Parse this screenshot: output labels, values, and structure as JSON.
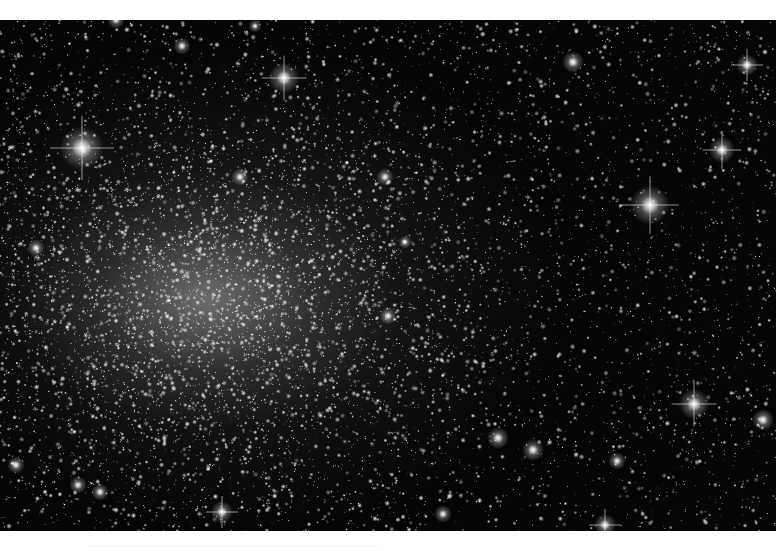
{
  "image": {
    "subject": "globular star cluster field (grayscale astronomical photograph)",
    "background_color": "#050505",
    "frame": {
      "x": 0,
      "y": 20,
      "width": 776,
      "height": 511
    },
    "cluster_core": {
      "x": 205,
      "y": 280,
      "radius_x": 190,
      "radius_y": 130
    },
    "star_density": {
      "field_stars": 5200,
      "cluster_stars": 3800
    },
    "bright_stars": [
      {
        "x": 82,
        "y": 128,
        "size": 10,
        "spikes": true
      },
      {
        "x": 650,
        "y": 185,
        "size": 9,
        "spikes": true
      },
      {
        "x": 284,
        "y": 58,
        "size": 7,
        "spikes": true
      },
      {
        "x": 722,
        "y": 130,
        "size": 6,
        "spikes": true
      },
      {
        "x": 694,
        "y": 384,
        "size": 7,
        "spikes": true
      },
      {
        "x": 763,
        "y": 400,
        "size": 5,
        "spikes": false
      },
      {
        "x": 573,
        "y": 42,
        "size": 5,
        "spikes": false
      },
      {
        "x": 747,
        "y": 45,
        "size": 5,
        "spikes": true
      },
      {
        "x": 533,
        "y": 430,
        "size": 5,
        "spikes": false
      },
      {
        "x": 498,
        "y": 418,
        "size": 5,
        "spikes": false
      },
      {
        "x": 605,
        "y": 505,
        "size": 5,
        "spikes": true
      },
      {
        "x": 78,
        "y": 465,
        "size": 4,
        "spikes": false
      },
      {
        "x": 16,
        "y": 445,
        "size": 4,
        "spikes": false
      },
      {
        "x": 100,
        "y": 472,
        "size": 4,
        "spikes": false
      },
      {
        "x": 222,
        "y": 492,
        "size": 5,
        "spikes": true
      },
      {
        "x": 116,
        "y": 0,
        "size": 4,
        "spikes": false
      },
      {
        "x": 182,
        "y": 26,
        "size": 4,
        "spikes": false
      },
      {
        "x": 385,
        "y": 157,
        "size": 4,
        "spikes": false
      },
      {
        "x": 388,
        "y": 296,
        "size": 4,
        "spikes": false
      },
      {
        "x": 240,
        "y": 157,
        "size": 4,
        "spikes": false
      },
      {
        "x": 36,
        "y": 228,
        "size": 4,
        "spikes": false
      },
      {
        "x": 617,
        "y": 441,
        "size": 4,
        "spikes": false
      },
      {
        "x": 443,
        "y": 494,
        "size": 4,
        "spikes": false
      },
      {
        "x": 255,
        "y": 6,
        "size": 3,
        "spikes": false
      },
      {
        "x": 405,
        "y": 222,
        "size": 3,
        "spikes": false
      }
    ]
  },
  "caption": {
    "text": "▁▁▁▁▁▁▁▁▁▁▁▁▁▁▁▁▁▁▁▁▁▁ ▁▁▁▁▁▁▁▁▁▁▁▁▁ ▁▁▁▁▁▁▁▁▁▁▁▁ ▁▁▁▁▁▁▁▁",
    "legible": false
  }
}
